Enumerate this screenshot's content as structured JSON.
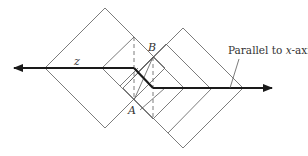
{
  "diagram": {
    "labels": {
      "z": "z",
      "a": "A",
      "b": "B"
    },
    "annotation": {
      "prefix": "Parallel to ",
      "italic": "x",
      "suffix": "-axis"
    },
    "colors": {
      "line": "#5a5a5a",
      "path": "#1a1a1a",
      "background": "#ffffff"
    }
  }
}
